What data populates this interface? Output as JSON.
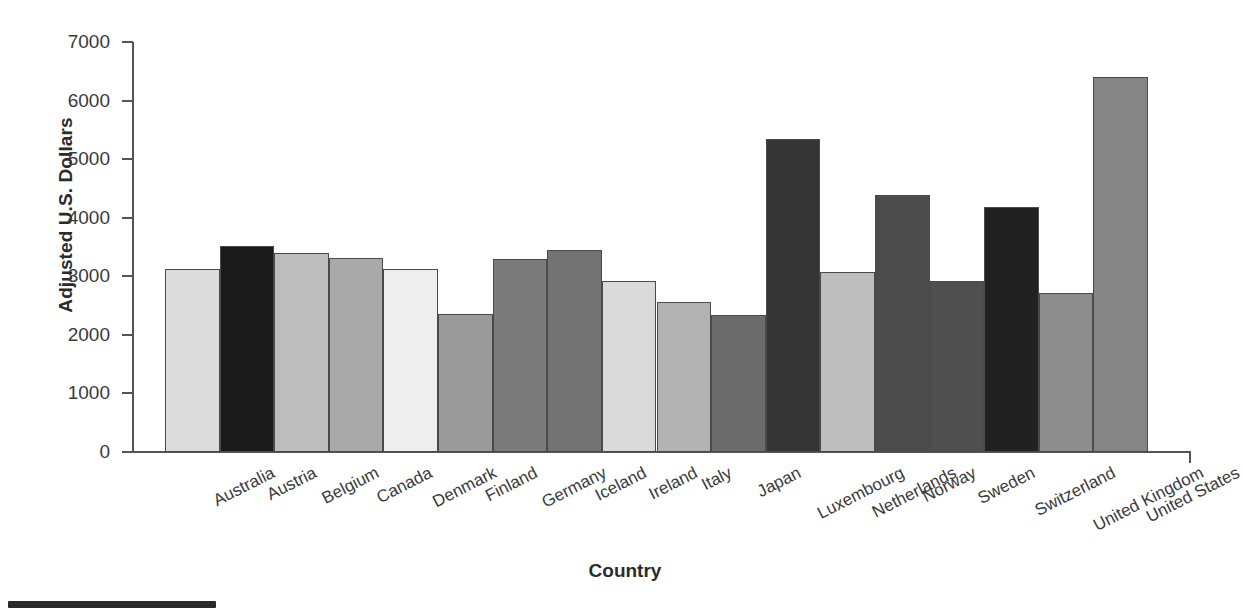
{
  "chart_data": {
    "type": "bar",
    "title": "",
    "xlabel": "Country",
    "ylabel": "Adjusted U.S. Dollars",
    "ylim": [
      0,
      7000
    ],
    "yticks": [
      0,
      1000,
      2000,
      3000,
      4000,
      5000,
      6000,
      7000
    ],
    "ytick_labels": [
      "0",
      "1000",
      "2000",
      "3000",
      "4000",
      "5000",
      "6000",
      "7000"
    ],
    "grid": false,
    "legend": null,
    "categories": [
      "Australia",
      "Austria",
      "Belgium",
      "Canada",
      "Denmark",
      "Finland",
      "Germany",
      "Iceland",
      "Ireland",
      "Italy",
      "Japan",
      "Luxembourg",
      "Netherlands",
      "Norway",
      "Sweden",
      "Switzerland",
      "United Kingdom",
      "United States"
    ],
    "values": [
      3120,
      3520,
      3390,
      3320,
      3120,
      2350,
      3290,
      3450,
      2920,
      2560,
      2340,
      5350,
      3080,
      4390,
      2920,
      4190,
      2710,
      6400
    ],
    "bar_colors": [
      "#dcdcdc",
      "#1a1a1a",
      "#bdbdbd",
      "#a9a9a9",
      "#eeeeee",
      "#9b9b9b",
      "#7b7b7b",
      "#737373",
      "#dadada",
      "#b2b2b2",
      "#6b6b6b",
      "#353535",
      "#bdbdbd",
      "#4c4c4c",
      "#4f4f4f",
      "#212121",
      "#8d8d8d",
      "#858585"
    ],
    "bar_edge_color": "#4a4a4a",
    "axis_color": "#555555",
    "background": "#ffffff"
  }
}
